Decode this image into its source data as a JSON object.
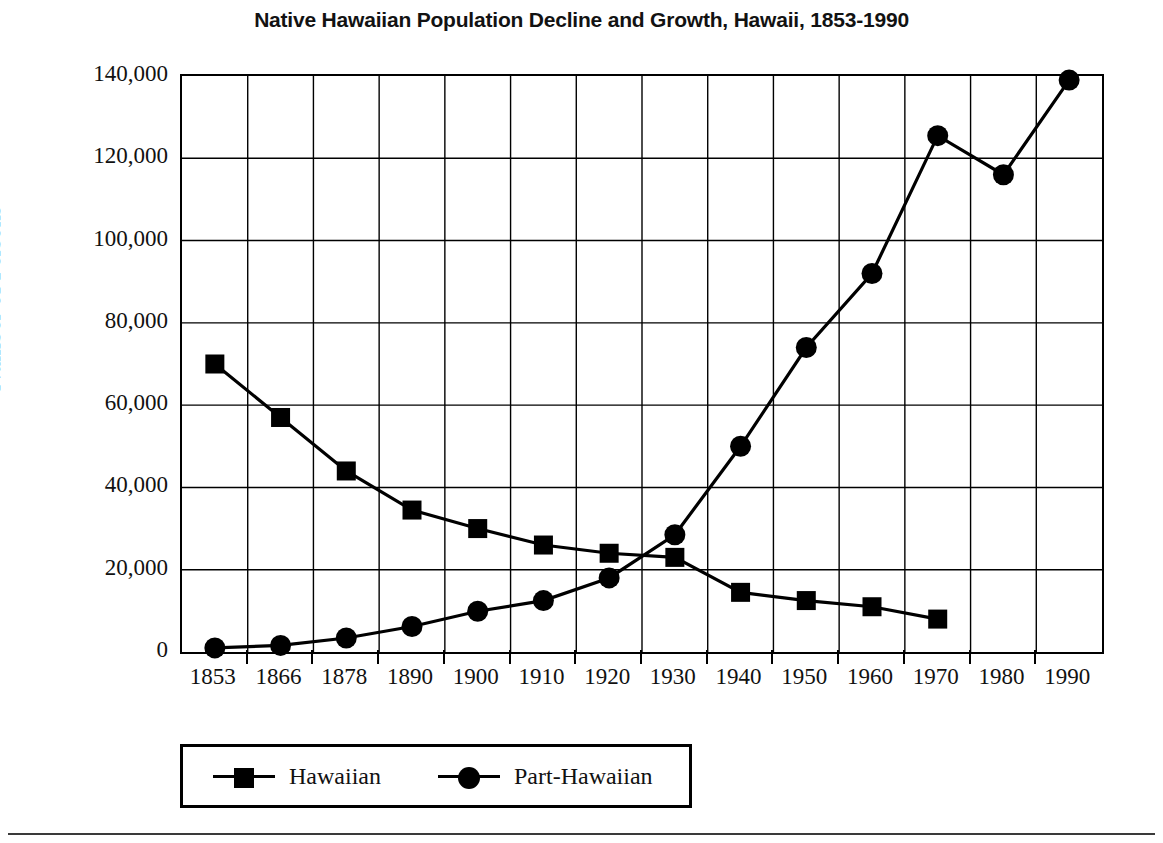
{
  "chart_data": {
    "type": "line",
    "title": "Native Hawaiian Population Decline and Growth, Hawaii, 1853-1990",
    "xlabel": "",
    "ylabel": "Number of Persons",
    "categories": [
      "1853",
      "1866",
      "1878",
      "1890",
      "1900",
      "1910",
      "1920",
      "1930",
      "1940",
      "1950",
      "1960",
      "1970",
      "1980",
      "1990"
    ],
    "ylim": [
      0,
      140000
    ],
    "ytick_values": [
      0,
      20000,
      40000,
      60000,
      80000,
      100000,
      120000,
      140000
    ],
    "ytick_labels": [
      "0",
      "20,000",
      "40,000",
      "60,000",
      "80,000",
      "100,000",
      "120,000",
      "140,000"
    ],
    "grid": true,
    "legend_position": "bottom-left",
    "series": [
      {
        "name": "Hawaiian",
        "marker": "square",
        "color": "#000000",
        "values": [
          70000,
          57000,
          44000,
          34500,
          30000,
          26000,
          24000,
          23000,
          14500,
          12500,
          11000,
          8000,
          null,
          null
        ]
      },
      {
        "name": "Part-Hawaiian",
        "marker": "circle",
        "color": "#000000",
        "values": [
          1000,
          1600,
          3400,
          6200,
          9900,
          12500,
          18000,
          28500,
          50000,
          74000,
          92000,
          125500,
          116000,
          139000
        ]
      }
    ]
  },
  "legend": {
    "entries": [
      {
        "label": "Hawaiian",
        "marker": "square"
      },
      {
        "label": "Part-Hawaiian",
        "marker": "circle"
      }
    ]
  }
}
